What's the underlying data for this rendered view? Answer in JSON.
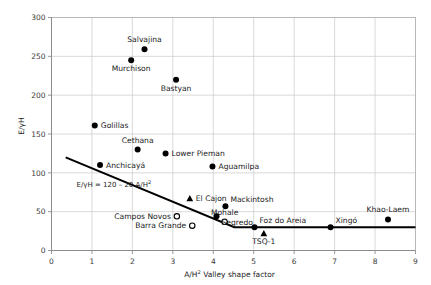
{
  "chart_data": {
    "type": "scatter",
    "title": "",
    "xlabel": "A/H² Valley shape factor",
    "xlabel_base": "A/H",
    "xlabel_sup": "2",
    "xlabel_rest": " Valley shape factor",
    "ylabel": "E/γH",
    "xlim": [
      0,
      9
    ],
    "ylim": [
      0,
      300
    ],
    "xticks": [
      "0",
      "1",
      "2",
      "3",
      "4",
      "5",
      "6",
      "7",
      "8",
      "9"
    ],
    "xtick_values": [
      0,
      1,
      2,
      3,
      4,
      5,
      6,
      7,
      8,
      9
    ],
    "yticks": [
      "0",
      "50",
      "100",
      "150",
      "200",
      "250",
      "300"
    ],
    "ytick_values": [
      0,
      50,
      100,
      150,
      200,
      250,
      300
    ],
    "grid": true,
    "grid_color": "#c9c9c9",
    "marker_color": "#000000",
    "line_color": "#000000",
    "annotation": {
      "text": "E/γH = 120 – 20 A/H²",
      "base": "E/γH = 120 – 20 A/H",
      "sup": "2",
      "x": 0.62,
      "y": 82
    },
    "trend_line": {
      "label": "E/γH = 120 – 20 A/H²",
      "points": [
        [
          0.35,
          120
        ],
        [
          4.52,
          30
        ],
        [
          9.0,
          30
        ]
      ]
    },
    "points": [
      {
        "name": "Salvajina",
        "x": 2.3,
        "y": 259,
        "marker": "filled-circle",
        "label_pos": "top"
      },
      {
        "name": "Murchison",
        "x": 1.97,
        "y": 245,
        "marker": "filled-circle",
        "label_pos": "bottom"
      },
      {
        "name": "Bastyan",
        "x": 3.08,
        "y": 220,
        "marker": "filled-circle",
        "label_pos": "bottom"
      },
      {
        "name": "Golillas",
        "x": 1.07,
        "y": 161,
        "marker": "filled-circle",
        "label_pos": "right"
      },
      {
        "name": "Cethana",
        "x": 2.13,
        "y": 130,
        "marker": "filled-circle",
        "label_pos": "top"
      },
      {
        "name": "Lower Pieman",
        "x": 2.82,
        "y": 125,
        "marker": "filled-circle",
        "label_pos": "right"
      },
      {
        "name": "Aguamilpa",
        "x": 3.98,
        "y": 108,
        "marker": "filled-circle",
        "label_pos": "right"
      },
      {
        "name": "Anchicayá",
        "x": 1.2,
        "y": 110,
        "marker": "filled-circle",
        "label_pos": "right"
      },
      {
        "name": "El Cajon",
        "x": 3.42,
        "y": 67,
        "marker": "filled-triangle",
        "label_pos": "right"
      },
      {
        "name": "Mackintosh",
        "x": 4.3,
        "y": 57,
        "marker": "filled-circle",
        "label_pos": "top-right"
      },
      {
        "name": "Campos Novos",
        "x": 3.1,
        "y": 44,
        "marker": "open-circle",
        "label_pos": "left"
      },
      {
        "name": "Barra Grande",
        "x": 3.48,
        "y": 32,
        "marker": "open-circle",
        "label_pos": "left"
      },
      {
        "name": "Mohale",
        "x": 4.28,
        "y": 37,
        "marker": "open-circle",
        "label_pos": "top"
      },
      {
        "name": "Segredo",
        "x": 4.08,
        "y": 44,
        "marker": "filled-circle",
        "label_pos": "bottom-right"
      },
      {
        "name": "Foz do Areia",
        "x": 5.02,
        "y": 30,
        "marker": "filled-circle",
        "label_pos": "top-right"
      },
      {
        "name": "TSQ-1",
        "x": 5.25,
        "y": 22,
        "marker": "filled-triangle",
        "label_pos": "bottom"
      },
      {
        "name": "Xingó",
        "x": 6.9,
        "y": 30,
        "marker": "filled-circle",
        "label_pos": "top-right"
      },
      {
        "name": "Khao-Laem",
        "x": 8.32,
        "y": 40,
        "marker": "filled-circle",
        "label_pos": "top"
      }
    ]
  }
}
